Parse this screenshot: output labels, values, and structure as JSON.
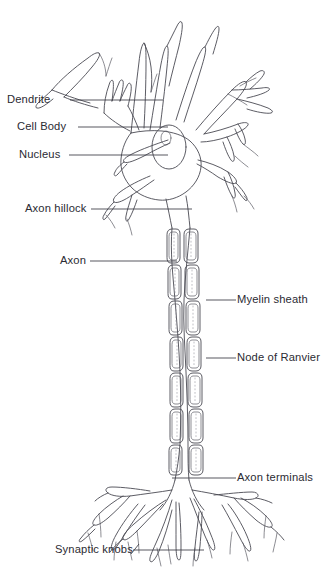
{
  "figure": {
    "type": "line-drawing",
    "background_color": "#ffffff",
    "ink_color": "#4a4a52",
    "label_color": "#2b2b33",
    "width": 327,
    "height": 570
  },
  "labels": {
    "dendrite": "Dendrite",
    "cell_body": "Cell Body",
    "nucleus": "Nucleus",
    "axon_hillock": "Axon hillock",
    "axon": "Axon",
    "myelin_sheath": "Myelin sheath",
    "node_of_ranvier": "Node of Ranvier",
    "axon_terminals": "Axon terminals",
    "synaptic_knobs": "Synaptic knobs"
  },
  "parts": [
    {
      "id": "dendrite",
      "label": "Dendrite",
      "side": "left",
      "label_x": 7,
      "label_y": 94,
      "leader": "M 70 100 L 163 100"
    },
    {
      "id": "cell-body",
      "label": "Cell Body",
      "side": "left",
      "label_x": 17,
      "label_y": 121,
      "leader": "M 78 127 L 168 127"
    },
    {
      "id": "nucleus",
      "label": "Nucleus",
      "side": "left",
      "label_x": 19,
      "label_y": 149,
      "leader": "M 69 155 L 168 155"
    },
    {
      "id": "axon-hillock",
      "label": "Axon hillock",
      "side": "left",
      "label_x": 25,
      "label_y": 203,
      "leader": "M 91 209 L 192 209"
    },
    {
      "id": "axon",
      "label": "Axon",
      "side": "left",
      "label_x": 60,
      "label_y": 255,
      "leader": "M 90 261 L 177 261"
    },
    {
      "id": "myelin-sheath",
      "label": "Myelin sheath",
      "side": "right",
      "label_x": 237,
      "label_y": 295,
      "leader": "M 206 300 L 236 300"
    },
    {
      "id": "node-of-ranvier",
      "label": "Node of Ranvier",
      "side": "right",
      "label_x": 237,
      "label_y": 353,
      "leader": "M 206 358 L 236 358"
    },
    {
      "id": "axon-terminals",
      "label": "Axon terminals",
      "side": "right",
      "label_x": 237,
      "label_y": 473,
      "leader": "M 172 478 L 236 478"
    },
    {
      "id": "synaptic-knobs",
      "label": "Synaptic knobs",
      "side": "left",
      "label_x": 55,
      "label_y": 545,
      "leader": "M 133 550 L 204 550"
    }
  ],
  "structures": {
    "myelin_segment_count": 7,
    "nucleus_shape": "oval",
    "nucleolus_shape": "small-oval",
    "dendrite_branch_count": 8,
    "terminal_branch_count": 9
  }
}
